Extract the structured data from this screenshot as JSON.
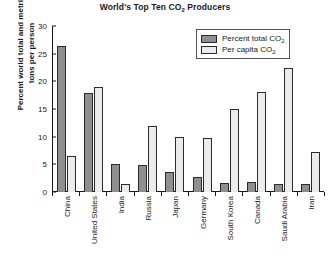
{
  "chart_data": {
    "type": "bar",
    "title": "World's Top Ten CO2 Producers",
    "title_main": "World's Top Ten CO",
    "title_sub": "2",
    "title_tail": " Producers",
    "xlabel": "",
    "ylabel_line1": "Percent world total and metric",
    "ylabel_line2": "tons per person",
    "ylabel": "Percent world total and metric tons per person",
    "ylim": [
      0,
      30
    ],
    "yticks": [
      0,
      5,
      10,
      15,
      20,
      25,
      30
    ],
    "grid": false,
    "legend_position": "top-right",
    "categories": [
      "China",
      "United States",
      "India",
      "Russia",
      "Japan",
      "Germany",
      "South Korea",
      "Canada",
      "Saudi Arabia",
      "Iran"
    ],
    "series": [
      {
        "name": "Percent total CO2",
        "name_main": "Percent total CO",
        "name_sub": "2",
        "color": "#8f8f8f",
        "values": [
          26.3,
          17.9,
          5.0,
          4.9,
          3.6,
          2.8,
          1.7,
          1.8,
          1.4,
          1.5
        ]
      },
      {
        "name": "Per capita CO2",
        "name_main": "Per capita CO",
        "name_sub": "2",
        "color": "#ebebeb",
        "values": [
          6.5,
          19.0,
          1.4,
          12.0,
          10.0,
          9.7,
          15.0,
          18.0,
          22.5,
          7.2
        ]
      }
    ]
  }
}
